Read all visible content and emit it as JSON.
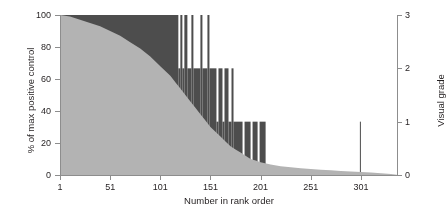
{
  "chart_data": {
    "type": "area",
    "title": "",
    "xlabel": "Number in rank order",
    "ylabel_left": "% of max positive control",
    "ylabel_right": "Visual grade",
    "xlim": [
      1,
      337
    ],
    "ylim_left": [
      0,
      100
    ],
    "ylim_right": [
      0,
      3
    ],
    "grid": false,
    "legend": null,
    "x_ticks": [
      1,
      51,
      101,
      151,
      201,
      251,
      301
    ],
    "x_tick_labels": [
      "1",
      "51",
      "101",
      "151",
      "201",
      "251",
      "301"
    ],
    "y_ticks_left": [
      0,
      20,
      40,
      60,
      80,
      100
    ],
    "y_tick_labels_left": [
      "0",
      "20",
      "40",
      "60",
      "80",
      "100"
    ],
    "y_ticks_right": [
      0,
      1,
      2,
      3
    ],
    "y_tick_labels_right": [
      "0",
      "1",
      "2",
      "3"
    ],
    "colors": {
      "area_light": "#b3b3b3",
      "bar_dark": "#4d4d4d",
      "axis": "#8d8d8d",
      "text": "#231f20",
      "background": "#ffffff"
    },
    "series": [
      {
        "name": "% of max positive control",
        "axis": "left",
        "render": "area",
        "color": "#b3b3b3",
        "description": "Monotonically decreasing rank-ordered curve from 100% at rank 1 down to near 0% by rank 337",
        "x": [
          1,
          11,
          21,
          31,
          41,
          51,
          61,
          71,
          81,
          91,
          101,
          106,
          111,
          116,
          121,
          126,
          131,
          136,
          141,
          146,
          151,
          156,
          161,
          166,
          171,
          176,
          181,
          186,
          191,
          196,
          201,
          211,
          221,
          231,
          241,
          251,
          261,
          271,
          281,
          291,
          301,
          311,
          321,
          331,
          337
        ],
        "values": [
          100,
          99,
          97,
          95,
          93,
          90,
          87,
          83,
          79,
          74,
          68,
          65,
          62,
          58,
          54,
          50,
          46,
          42,
          38,
          34,
          30,
          27,
          24,
          21,
          18,
          16,
          14,
          12,
          10,
          9,
          8,
          6.5,
          5.5,
          4.8,
          4.2,
          3.7,
          3.3,
          2.9,
          2.5,
          2.2,
          1.9,
          1.5,
          1.1,
          0.6,
          0.2
        ]
      },
      {
        "name": "Visual grade",
        "axis": "right",
        "render": "vertical-bars",
        "color": "#4d4d4d",
        "description": "Per-sample visual grade (0-3) drawn as full-height vertical bars; grade 3 dominates ranks 1-125, grade 2 ranks ~126-168, grade 1 ranks ~169-205 plus one isolated sample near rank 300, grade 0 thereafter",
        "grade_runs": [
          {
            "from": 1,
            "to": 118,
            "grade": 3
          },
          {
            "from": 119,
            "to": 120,
            "grade": 2
          },
          {
            "from": 121,
            "to": 122,
            "grade": 3
          },
          {
            "from": 123,
            "to": 124,
            "grade": 2
          },
          {
            "from": 125,
            "to": 127,
            "grade": 3
          },
          {
            "from": 128,
            "to": 131,
            "grade": 2
          },
          {
            "from": 132,
            "to": 133,
            "grade": 3
          },
          {
            "from": 134,
            "to": 140,
            "grade": 2
          },
          {
            "from": 141,
            "to": 142,
            "grade": 3
          },
          {
            "from": 143,
            "to": 147,
            "grade": 2
          },
          {
            "from": 148,
            "to": 149,
            "grade": 3
          },
          {
            "from": 150,
            "to": 156,
            "grade": 2
          },
          {
            "from": 157,
            "to": 158,
            "grade": 1
          },
          {
            "from": 159,
            "to": 162,
            "grade": 2
          },
          {
            "from": 163,
            "to": 164,
            "grade": 1
          },
          {
            "from": 165,
            "to": 168,
            "grade": 2
          },
          {
            "from": 169,
            "to": 171,
            "grade": 1
          },
          {
            "from": 172,
            "to": 173,
            "grade": 2
          },
          {
            "from": 174,
            "to": 182,
            "grade": 1
          },
          {
            "from": 183,
            "to": 184,
            "grade": 0
          },
          {
            "from": 185,
            "to": 190,
            "grade": 1
          },
          {
            "from": 191,
            "to": 192,
            "grade": 0
          },
          {
            "from": 193,
            "to": 197,
            "grade": 1
          },
          {
            "from": 198,
            "to": 199,
            "grade": 0
          },
          {
            "from": 200,
            "to": 205,
            "grade": 1
          },
          {
            "from": 206,
            "to": 299,
            "grade": 0
          },
          {
            "from": 300,
            "to": 300,
            "grade": 1
          },
          {
            "from": 301,
            "to": 337,
            "grade": 0
          }
        ]
      }
    ]
  }
}
